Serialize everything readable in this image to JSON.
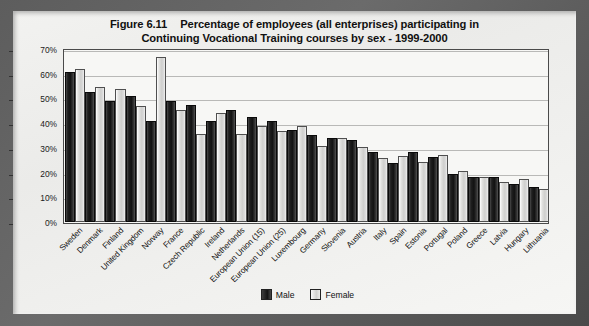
{
  "figure": {
    "number": "Figure 6.11",
    "title_line1": "Percentage of employees (all enterprises) participating in",
    "title_line2": "Continuing Vocational Training courses by sex - 1999-2000"
  },
  "legend": {
    "male": "Male",
    "female": "Female"
  },
  "axis": {
    "yticks": [
      "70%",
      "60%",
      "50%",
      "40%",
      "30%",
      "20%",
      "10%",
      "0%"
    ]
  },
  "chart_data": {
    "type": "bar",
    "xlabel": "",
    "ylabel": "",
    "ylim": [
      0,
      70
    ],
    "ytick_values": [
      0,
      10,
      20,
      30,
      40,
      50,
      60,
      70
    ],
    "ytick_labels": [
      "0%",
      "10%",
      "20%",
      "30%",
      "40%",
      "50%",
      "60%",
      "70%"
    ],
    "grid": true,
    "legend_position": "bottom-center",
    "categories": [
      "Sweden",
      "Denmark",
      "Finland",
      "United Kingdom",
      "Norway",
      "France",
      "Czech Republic",
      "Ireland",
      "Netherlands",
      "European Union (15)",
      "European Union (25)",
      "Luxembourg",
      "Germany",
      "Slovenia",
      "Austria",
      "Italy",
      "Spain",
      "Estonia",
      "Portugal",
      "Poland",
      "Greece",
      "Latvia",
      "Hungary",
      "Lithuania"
    ],
    "series": [
      {
        "name": "Male",
        "color": "#1a1a1a",
        "values": [
          60,
          52,
          48,
          50,
          40,
          48,
          46.5,
          40,
          44.5,
          41.5,
          40,
          36.5,
          34.5,
          33,
          32.5,
          27.5,
          23,
          27.5,
          25.5,
          18.5,
          17.5,
          17.5,
          14.5,
          13.5
        ]
      },
      {
        "name": "Female",
        "color": "#dcdcda",
        "values": [
          61,
          54,
          53,
          46,
          66,
          44.5,
          35,
          43.5,
          35,
          38,
          36,
          38,
          30,
          33,
          29.5,
          25,
          26,
          23.5,
          26.5,
          20,
          17.5,
          15.5,
          16.5,
          12.5
        ]
      }
    ]
  }
}
